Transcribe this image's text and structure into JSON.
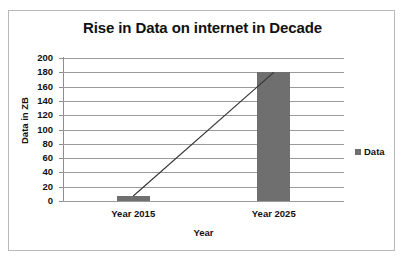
{
  "chart_data": {
    "type": "bar",
    "title": "Rise in Data on internet in Decade",
    "xlabel": "Year",
    "ylabel": "Data in ZB",
    "categories": [
      "Year 2015",
      "Year 2025"
    ],
    "series": [
      {
        "name": "Data",
        "values": [
          7,
          180
        ],
        "color": "#6f6f6f",
        "type": "bar"
      },
      {
        "name": "Data",
        "values": [
          7,
          180
        ],
        "color": "#333333",
        "type": "line"
      }
    ],
    "values": [
      7,
      180
    ],
    "ylim": [
      0,
      200
    ],
    "ytick_step": 20,
    "yticks": [
      200,
      180,
      160,
      140,
      120,
      100,
      80,
      60,
      40,
      20,
      0
    ],
    "grid": true,
    "legend": {
      "position": "right",
      "entries": [
        "Data"
      ]
    }
  },
  "legend": {
    "swatch_name": "data-series-swatch",
    "label": "Data"
  },
  "colors": {
    "bar": "#6f6f6f",
    "gridline": "#9a9a9a",
    "axis": "#8d8d8d",
    "border": "#b9b9b9",
    "text": "#111111"
  }
}
